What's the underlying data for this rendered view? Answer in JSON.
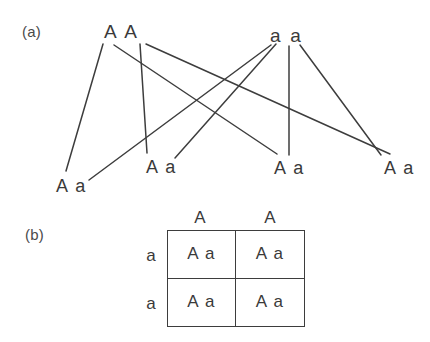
{
  "figure": {
    "background_color": "#ffffff",
    "stroke_color": "#3d3d3d",
    "text_color": "#3a3a3a"
  },
  "panel_a": {
    "letter": "(a)",
    "parents": [
      {
        "id": "parent-left",
        "genotype": "A A"
      },
      {
        "id": "parent-right",
        "genotype": "a a"
      }
    ],
    "offspring": [
      {
        "id": "offspring-1",
        "genotype": "A a"
      },
      {
        "id": "offspring-2",
        "genotype": "A a"
      },
      {
        "id": "offspring-3",
        "genotype": "A a"
      },
      {
        "id": "offspring-4",
        "genotype": "A a"
      }
    ],
    "cross_lines": [
      {
        "from": "parent-left",
        "to": "offspring-1",
        "x1": 103,
        "y1": 44,
        "x2": 66,
        "y2": 171
      },
      {
        "from": "parent-left",
        "to": "offspring-2",
        "x1": 140,
        "y1": 44,
        "x2": 147,
        "y2": 153
      },
      {
        "from": "parent-left",
        "to": "offspring-3",
        "x1": 114,
        "y1": 45,
        "x2": 277,
        "y2": 154
      },
      {
        "from": "parent-left",
        "to": "offspring-4",
        "x1": 146,
        "y1": 44,
        "x2": 390,
        "y2": 154
      },
      {
        "from": "parent-right",
        "to": "offspring-1",
        "x1": 271,
        "y1": 45,
        "x2": 89,
        "y2": 180
      },
      {
        "from": "parent-right",
        "to": "offspring-2",
        "x1": 276,
        "y1": 44,
        "x2": 175,
        "y2": 158
      },
      {
        "from": "parent-right",
        "to": "offspring-3",
        "x1": 289,
        "y1": 46,
        "x2": 289,
        "y2": 155
      },
      {
        "from": "parent-right",
        "to": "offspring-4",
        "x1": 300,
        "y1": 45,
        "x2": 381,
        "y2": 155
      }
    ]
  },
  "panel_b": {
    "letter": "(b)",
    "column_headers": [
      "A",
      "A"
    ],
    "row_headers": [
      "a",
      "a"
    ],
    "cells": [
      [
        "A a",
        "A a"
      ],
      [
        "A a",
        "A a"
      ]
    ]
  },
  "chart_data": {
    "type": "diagram",
    "panels": [
      {
        "label": "(a)",
        "description": "Line cross diagram linking parental gametes to offspring genotypes",
        "parents": [
          "A A",
          "a a"
        ],
        "offspring": [
          "A a",
          "A a",
          "A a",
          "A a"
        ],
        "edges": 8
      },
      {
        "label": "(b)",
        "description": "Punnett square of the same cross",
        "columns": [
          "A",
          "A"
        ],
        "rows": [
          "a",
          "a"
        ],
        "grid": [
          [
            "A a",
            "A a"
          ],
          [
            "A a",
            "A a"
          ]
        ],
        "ratio": "100% Aa"
      }
    ]
  }
}
